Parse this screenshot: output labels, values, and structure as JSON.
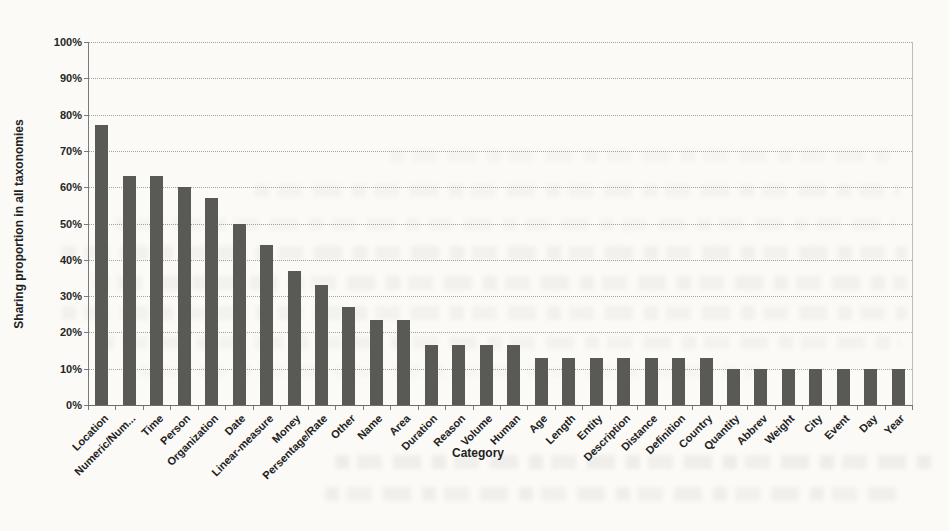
{
  "page": {
    "background_color": "#fbfaf7",
    "description_kind": "scanned-document-bar-chart"
  },
  "chart_data": {
    "type": "bar",
    "title": "",
    "xlabel": "Category",
    "ylabel": "Sharing proportion in all taxonomies",
    "categories": [
      "Location",
      "Numeric/Num...",
      "Time",
      "Person",
      "Organization",
      "Date",
      "Linear-measure",
      "Money",
      "Persentage/Rate",
      "Other",
      "Name",
      "Area",
      "Duration",
      "Reason",
      "Volume",
      "Human",
      "Age",
      "Length",
      "Entity",
      "Description",
      "Distance",
      "Definition",
      "Country",
      "Quantity",
      "Abbrev",
      "Weight",
      "City",
      "Event",
      "Day",
      "Year"
    ],
    "values": [
      77,
      63,
      63,
      60,
      57,
      50,
      44,
      37,
      33,
      27,
      23.5,
      23.5,
      16.5,
      16.5,
      16.5,
      16.5,
      13,
      13,
      13,
      13,
      13,
      13,
      13,
      10,
      10,
      10,
      10,
      10,
      10,
      10
    ],
    "ylim": [
      0,
      100
    ],
    "ytick_step": 10,
    "ytick_suffix": "%",
    "yticks": [
      "0%",
      "10%",
      "20%",
      "30%",
      "40%",
      "50%",
      "60%",
      "70%",
      "80%",
      "90%",
      "100%"
    ],
    "grid": "horizontal-dotted",
    "legend": "none",
    "bar_color": "#595955",
    "axis_color": "#6e6e6a",
    "gridline_color": "#a3a39d"
  }
}
